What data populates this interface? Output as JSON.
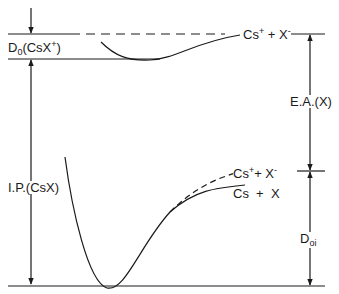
{
  "diagram": {
    "type": "potential-energy-diagram",
    "colors": {
      "line": "#1a1a1a",
      "background": "#ffffff"
    },
    "labels": {
      "d0_ion": {
        "main": "D",
        "sub": "0",
        "rest": "(CsX",
        "sup": "+",
        "close": ")"
      },
      "ion_limit": {
        "a": "Cs",
        "a_sup": "+",
        "plus": " + X",
        "b_sup": "-"
      },
      "ea": "E.A.(X)",
      "ip": "I.P.(CsX)",
      "ion_pair": {
        "a": "Cs",
        "a_sup": "+",
        "plus": "+ X",
        "b_sup": "-"
      },
      "neutral": "Cs  +  X",
      "d0i": {
        "main": "D",
        "sub": "oi"
      }
    },
    "levels": [
      {
        "name": "Cs+ + X- asymptote",
        "style": "dashed",
        "y": 33
      },
      {
        "name": "CsX+ minimum",
        "style": "solid",
        "y": 57
      },
      {
        "name": "Cs+ + X- / Cs + X separation",
        "style": "solid-tick",
        "y": 171
      },
      {
        "name": "CsX ground minimum",
        "style": "solid",
        "y": 285
      }
    ],
    "arrows": [
      {
        "name": "D0(CsX+)",
        "x": 33,
        "from_y": 57,
        "to_y": 33
      },
      {
        "name": "I.P.(CsX)",
        "x": 33,
        "from_y": 57,
        "to_y": 285
      },
      {
        "name": "E.A.(X)",
        "x": 310,
        "from_y": 171,
        "to_y": 33
      },
      {
        "name": "D0i",
        "x": 310,
        "from_y": 171,
        "to_y": 285
      }
    ]
  }
}
